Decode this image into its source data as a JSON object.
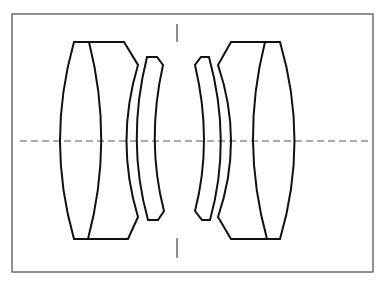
{
  "diagram": {
    "type": "optical-lens-cross-section",
    "elements": [
      {
        "name": "front-cemented-doublet",
        "position": "left-outer"
      },
      {
        "name": "front-meniscus",
        "position": "left-inner"
      },
      {
        "name": "rear-meniscus",
        "position": "right-inner"
      },
      {
        "name": "rear-cemented-doublet",
        "position": "right-outer"
      }
    ],
    "optical_axis": {
      "style": "dashed",
      "orientation": "horizontal"
    },
    "aperture_stop": {
      "marks": [
        "top-tick",
        "bottom-tick"
      ],
      "orientation": "vertical"
    },
    "colors": {
      "line": "#111111",
      "frame": "#555555",
      "background": "#ffffff"
    }
  }
}
